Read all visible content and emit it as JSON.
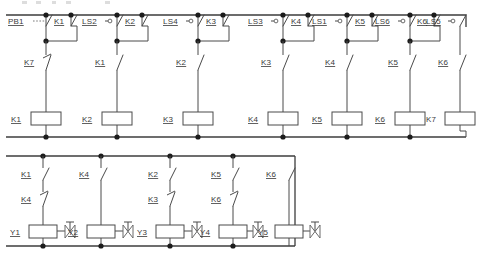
{
  "diagram": {
    "colors": {
      "wire": "#4a4a4a",
      "rail": "#3c3c3c",
      "node": "#1c1c1c",
      "text": "#3a3a3a",
      "background": "#ffffff"
    }
  },
  "upper_section": {
    "rungs": [
      {
        "id": "rung-1",
        "top_devices": [
          {
            "label": "PB1",
            "type": "pushbutton-no",
            "underline": true
          },
          {
            "label": "K1",
            "type": "contact-no",
            "underline": true
          }
        ],
        "series_contact": {
          "label": "K7",
          "type": "contact-nc",
          "underline": true
        },
        "coil": {
          "label": "K1",
          "type": "relay-coil",
          "underline": true
        }
      },
      {
        "id": "rung-2",
        "top_devices": [
          {
            "label": "LS2",
            "type": "limit-switch-no",
            "underline": true
          },
          {
            "label": "K2",
            "type": "contact-no",
            "underline": true
          }
        ],
        "series_contact": {
          "label": "K1",
          "type": "contact-no",
          "underline": true
        },
        "coil": {
          "label": "K2",
          "type": "relay-coil",
          "underline": true
        }
      },
      {
        "id": "rung-3",
        "top_devices": [
          {
            "label": "LS4",
            "type": "limit-switch-no",
            "underline": true
          },
          {
            "label": "K3",
            "type": "contact-no",
            "underline": true
          }
        ],
        "series_contact": {
          "label": "K2",
          "type": "contact-no",
          "underline": true
        },
        "coil": {
          "label": "K3",
          "type": "relay-coil",
          "underline": true
        }
      },
      {
        "id": "rung-4",
        "top_devices": [
          {
            "label": "LS3",
            "type": "limit-switch-no",
            "underline": true
          },
          {
            "label": "K4",
            "type": "contact-no",
            "underline": true
          }
        ],
        "series_contact": {
          "label": "K3",
          "type": "contact-no",
          "underline": true
        },
        "coil": {
          "label": "K4",
          "type": "relay-coil",
          "underline": true
        }
      },
      {
        "id": "rung-5",
        "top_devices": [
          {
            "label": "LS1",
            "type": "limit-switch-no",
            "underline": true
          },
          {
            "label": "K5",
            "type": "contact-no",
            "underline": true
          }
        ],
        "series_contact": {
          "label": "K4",
          "type": "contact-no",
          "underline": true
        },
        "coil": {
          "label": "K5",
          "type": "relay-coil",
          "underline": true
        }
      },
      {
        "id": "rung-6",
        "top_devices": [
          {
            "label": "LS6",
            "type": "limit-switch-no",
            "underline": true
          },
          {
            "label": "K6",
            "type": "contact-no",
            "underline": true
          }
        ],
        "series_contact": {
          "label": "K5",
          "type": "contact-no",
          "underline": true
        },
        "coil": {
          "label": "K6",
          "type": "relay-coil",
          "underline": true
        }
      },
      {
        "id": "rung-7",
        "top_devices": [
          {
            "label": "LS5",
            "type": "limit-switch-no",
            "underline": true
          }
        ],
        "series_contact": {
          "label": "K6",
          "type": "contact-no",
          "underline": true
        },
        "coil": {
          "label": "K7",
          "type": "relay-coil",
          "underline": false
        }
      }
    ]
  },
  "lower_section": {
    "rungs": [
      {
        "id": "valve-rung-1",
        "contact_a": {
          "label": "K1",
          "type": "contact-no",
          "underline": true
        },
        "contact_b": {
          "label": "K4",
          "type": "contact-nc",
          "underline": true
        },
        "solenoid": {
          "label": "Y1",
          "type": "solenoid-valve",
          "underline": true
        }
      },
      {
        "id": "valve-rung-2",
        "contact_a": {
          "label": "K4",
          "type": "contact-no",
          "underline": true
        },
        "contact_b": null,
        "solenoid": {
          "label": "Y2",
          "type": "solenoid-valve",
          "underline": true
        }
      },
      {
        "id": "valve-rung-3",
        "contact_a": {
          "label": "K2",
          "type": "contact-no",
          "underline": true
        },
        "contact_b": {
          "label": "K3",
          "type": "contact-nc",
          "underline": true
        },
        "solenoid": {
          "label": "Y3",
          "type": "solenoid-valve",
          "underline": true
        }
      },
      {
        "id": "valve-rung-4",
        "contact_a": {
          "label": "K5",
          "type": "contact-no",
          "underline": true
        },
        "contact_b": {
          "label": "K6",
          "type": "contact-nc",
          "underline": true
        },
        "solenoid": {
          "label": "Y4",
          "type": "solenoid-valve",
          "underline": true
        }
      },
      {
        "id": "valve-rung-5",
        "contact_a": {
          "label": "K6",
          "type": "contact-no",
          "underline": true
        },
        "contact_b": null,
        "solenoid": {
          "label": "Y5",
          "type": "solenoid-valve",
          "underline": true
        }
      }
    ]
  }
}
